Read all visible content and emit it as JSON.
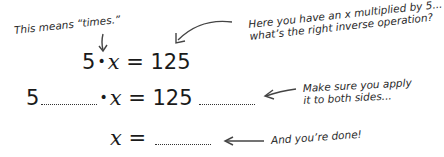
{
  "annotations": {
    "times_note": "This means “times.”",
    "inverse_note_line1": "Here you have an x multiplied by 5...",
    "inverse_note_line2": "what’s the right inverse operation?",
    "both_sides_note_line1": "Make sure you apply",
    "both_sides_note_line2": "it to both sides...",
    "done_note": "And you’re done!"
  },
  "equations": {
    "row1": {
      "left": "5",
      "dot": "•",
      "var": "x",
      "equals": "=",
      "right": "125"
    },
    "row2": {
      "left": "5",
      "dot": "•",
      "var": "x",
      "equals": "=",
      "right": "125",
      "blank_left": "",
      "blank_right": ""
    },
    "row3": {
      "var": "x",
      "equals": "=",
      "blank": ""
    }
  },
  "colors": {
    "ink": "#1a1a1a",
    "arrow": "#444444",
    "background": "#ffffff"
  }
}
